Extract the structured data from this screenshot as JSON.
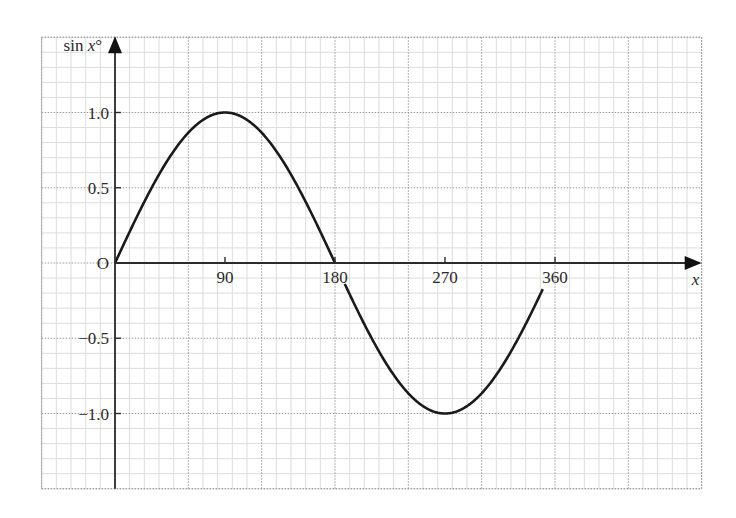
{
  "chart_data": {
    "type": "line",
    "title": "",
    "function": "y = sin x°",
    "xlabel": "x",
    "ylabel": "sin x°",
    "ylabel_parts": {
      "prefix": "sin ",
      "var": "x",
      "suffix": "°"
    },
    "origin_label": "O",
    "xlim": [
      -60,
      480
    ],
    "ylim": [
      -1.5,
      1.5
    ],
    "x_ticks": [
      {
        "value": 90,
        "label": "90"
      },
      {
        "value": 180,
        "label": "180"
      },
      {
        "value": 270,
        "label": "270"
      },
      {
        "value": 360,
        "label": "360"
      }
    ],
    "y_ticks": [
      {
        "value": 1.0,
        "label": "1.0"
      },
      {
        "value": 0.5,
        "label": "0.5"
      },
      {
        "value": -0.5,
        "label": "−0.5"
      },
      {
        "value": -1.0,
        "label": "−1.0"
      }
    ],
    "grid": {
      "on": true,
      "major_x_step": 60,
      "major_y_step": 0.5,
      "minor_subdivisions": 5,
      "major_style": "dotted",
      "major_color": "#9a9a9a",
      "minor_color": "#dcdcdc"
    },
    "series": [
      {
        "name": "sin x°",
        "color": "#1a1a1a",
        "x": [
          0,
          15,
          30,
          45,
          60,
          75,
          90,
          105,
          120,
          135,
          150,
          165,
          180,
          195,
          210,
          225,
          240,
          255,
          270,
          285,
          300,
          315,
          330,
          345,
          350
        ],
        "values": [
          0,
          0.259,
          0.5,
          0.707,
          0.866,
          0.966,
          1.0,
          0.966,
          0.866,
          0.707,
          0.5,
          0.259,
          0,
          -0.259,
          -0.5,
          -0.707,
          -0.866,
          -0.966,
          -1.0,
          -0.966,
          -0.866,
          -0.707,
          -0.5,
          -0.259,
          -0.174
        ]
      }
    ],
    "annotations": [
      "Curve broken beneath the '180' label (between x≈180 and x≈188)",
      "Curve ends at x≈350 just below the '360' label"
    ],
    "legend": "none",
    "colors": {
      "axis": "#2b2b2b",
      "curve": "#1a1a1a",
      "background": "#ffffff"
    }
  }
}
